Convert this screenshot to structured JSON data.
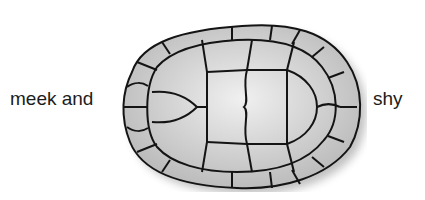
{
  "illustration": {
    "subject": "turtle-shell",
    "left_label": "meek and",
    "right_label": "shy",
    "colors": {
      "scute_fill": "#c8c8c8",
      "scute_highlight": "#ececec",
      "outline": "#141414",
      "shadow": "#9a9a9a",
      "text": "#1c1c1c"
    }
  }
}
